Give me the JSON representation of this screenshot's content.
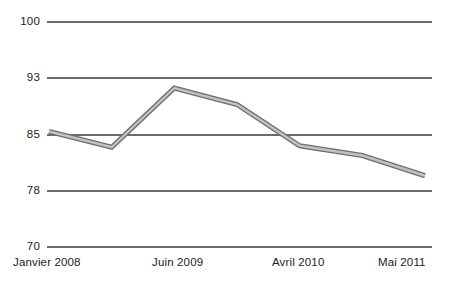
{
  "chart_data": {
    "type": "line",
    "title": "",
    "subtitle": "",
    "xlabel": "",
    "ylabel": "",
    "grid": true,
    "legend": "none",
    "ylim": [
      70,
      100
    ],
    "yticks": [
      70,
      78,
      85,
      93,
      100
    ],
    "ytick_labels": [
      "70",
      "78",
      "85",
      "93",
      "100"
    ],
    "xtick_labels": [
      "Janvier 2008",
      "Juin 2009",
      "Avril 2010",
      "Mai 2011"
    ],
    "x": [
      "Janvier 2008",
      "",
      "Juin 2009",
      "",
      "Avril 2010",
      "",
      "Mai 2011"
    ],
    "series": [
      {
        "name": "",
        "color": "#8c8c8c",
        "values": [
          85.4,
          83.3,
          91.2,
          89.0,
          83.5,
          82.2,
          79.5
        ]
      }
    ],
    "annotations": []
  },
  "axis": {
    "y_labels": [
      {
        "text": "100",
        "value": 100
      },
      {
        "text": "93",
        "value": 93
      },
      {
        "text": "85",
        "value": 85
      },
      {
        "text": "78",
        "value": 78
      },
      {
        "text": "70",
        "value": 70
      }
    ],
    "x_labels": [
      {
        "text": "Janvier 2008"
      },
      {
        "text": "Juin 2009"
      },
      {
        "text": "Avril 2010"
      },
      {
        "text": "Mai 2011"
      }
    ]
  },
  "colors": {
    "background": "#ffffff",
    "gridline": "#3a3a3a",
    "line_fill": "#b3b3b3",
    "line_edge": "#6e6e6e",
    "text": "#1c1c1c"
  }
}
